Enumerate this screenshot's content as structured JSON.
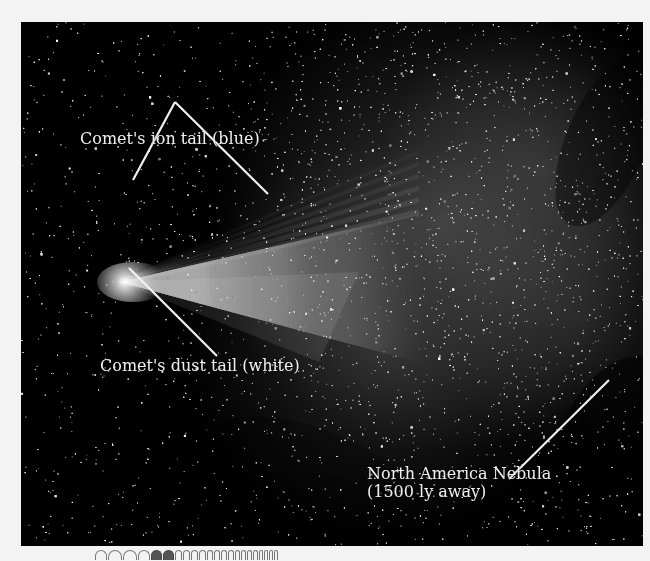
{
  "photo": {
    "subject": "Comet with ion and dust tails against star field near North America Nebula",
    "background_color": "#000000",
    "comet_head": {
      "x": 98,
      "y": 260
    }
  },
  "labels": [
    {
      "id": "ion-tail",
      "text": "Comet's ion tail (blue)",
      "x": 59,
      "y": 123
    },
    {
      "id": "dust-tail",
      "text": "Comet's dust tail (white)",
      "x": 79,
      "y": 350
    },
    {
      "id": "nebula-line1",
      "text": "North America Nebula",
      "x": 346,
      "y": 458
    },
    {
      "id": "nebula-line2",
      "text": "(1500 ly away)",
      "x": 346,
      "y": 475
    }
  ],
  "leader_lines": [
    {
      "from": [
        112,
        158
      ],
      "to": [
        154,
        80
      ]
    },
    {
      "from": [
        154,
        80
      ],
      "to": [
        247,
        172
      ]
    },
    {
      "from": [
        108,
        246
      ],
      "to": [
        196,
        334
      ]
    },
    {
      "from": [
        588,
        358
      ],
      "to": [
        488,
        457
      ]
    }
  ],
  "bottom_strip": {
    "description": "cropped wavelength graphic",
    "arcs": [
      {
        "w": 10,
        "dark": false
      },
      {
        "w": 12,
        "dark": false
      },
      {
        "w": 12,
        "dark": false
      },
      {
        "w": 10,
        "dark": false
      },
      {
        "w": 9,
        "dark": true
      },
      {
        "w": 9,
        "dark": true
      },
      {
        "w": 5,
        "dark": false
      },
      {
        "w": 5,
        "dark": false
      },
      {
        "w": 5,
        "dark": false
      },
      {
        "w": 5,
        "dark": false
      },
      {
        "w": 4,
        "dark": false
      },
      {
        "w": 4,
        "dark": false
      },
      {
        "w": 4,
        "dark": false
      },
      {
        "w": 4,
        "dark": false
      },
      {
        "w": 3,
        "dark": false
      },
      {
        "w": 3,
        "dark": false
      },
      {
        "w": 3,
        "dark": false
      },
      {
        "w": 3,
        "dark": false
      },
      {
        "w": 2,
        "dark": false
      },
      {
        "w": 2,
        "dark": false
      },
      {
        "w": 2,
        "dark": false
      },
      {
        "w": 2,
        "dark": false
      }
    ]
  }
}
